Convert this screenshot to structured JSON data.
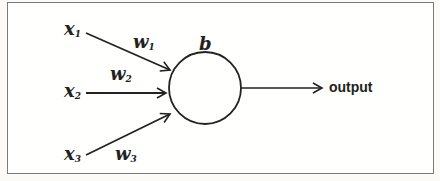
{
  "diagram": {
    "inputs": [
      {
        "label": "x",
        "subscript": "1",
        "weight": "w",
        "weight_subscript": "1"
      },
      {
        "label": "x",
        "subscript": "2",
        "weight": "w",
        "weight_subscript": "2"
      },
      {
        "label": "x",
        "subscript": "3",
        "weight": "w",
        "weight_subscript": "3"
      }
    ],
    "neuron": {
      "bias_label": "b"
    },
    "output_label": "output",
    "colors": {
      "stroke": "#222222",
      "frame": "#7a7a7a",
      "background": "#fffffd"
    }
  }
}
